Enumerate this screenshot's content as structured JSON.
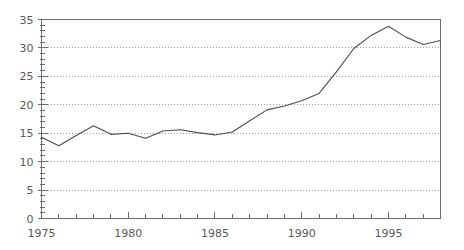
{
  "chart_data": {
    "type": "line",
    "title": "",
    "subtitle": "",
    "xlabel": "",
    "ylabel": "",
    "xlim": [
      1975,
      1998
    ],
    "ylim": [
      0,
      35
    ],
    "grid": true,
    "grid_axis": "y",
    "legend": false,
    "legend_position": "none",
    "x_tick_labels": [
      "1975",
      "1980",
      "1985",
      "1990",
      "1995"
    ],
    "x_major_ticks": [
      1975,
      1980,
      1985,
      1990,
      1995
    ],
    "x_minor_tick_step": 1,
    "y_tick_labels": [
      "0",
      "5",
      "10",
      "15",
      "20",
      "25",
      "30",
      "35"
    ],
    "y_major_ticks": [
      0,
      5,
      10,
      15,
      20,
      25,
      30,
      35
    ],
    "y_minor_tick_step": 1,
    "x": [
      1975,
      1976,
      1977,
      1978,
      1979,
      1980,
      1981,
      1982,
      1983,
      1984,
      1985,
      1986,
      1987,
      1988,
      1989,
      1990,
      1991,
      1992,
      1993,
      1994,
      1995,
      1996,
      1997,
      1998
    ],
    "values": [
      14.3,
      12.8,
      14.6,
      16.3,
      14.8,
      15.0,
      14.1,
      15.4,
      15.6,
      15.1,
      14.7,
      15.2,
      17.2,
      19.1,
      19.8,
      20.7,
      22.0,
      25.8,
      29.9,
      32.2,
      33.8,
      31.9,
      30.6,
      31.3
    ],
    "series": [
      {
        "name": "series-1",
        "values": [
          14.3,
          12.8,
          14.6,
          16.3,
          14.8,
          15.0,
          14.1,
          15.4,
          15.6,
          15.1,
          14.7,
          15.2,
          17.2,
          19.1,
          19.8,
          20.7,
          22.0,
          25.8,
          29.9,
          32.2,
          33.8,
          31.9,
          30.6,
          31.3
        ]
      }
    ]
  },
  "style": {
    "line_color": "#4d4d52",
    "axis_color": "#6b6b70",
    "grid_color": "#9a9a9e",
    "tick_label_color": "#58585a",
    "background_color": "#ffffff"
  }
}
